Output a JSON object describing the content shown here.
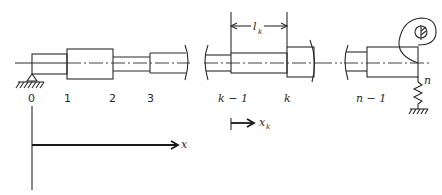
{
  "diagram": {
    "station_labels": [
      "0",
      "1",
      "2",
      "3",
      "k − 1",
      "k",
      "n − 1"
    ],
    "end_label": "n",
    "segment_length_label": "l",
    "segment_length_subscript": "k",
    "local_coord_label": "x",
    "local_coord_subscript": "k",
    "global_axis_label": "x",
    "supports": {
      "left": "pin-support",
      "right": "spring-to-ground"
    }
  }
}
